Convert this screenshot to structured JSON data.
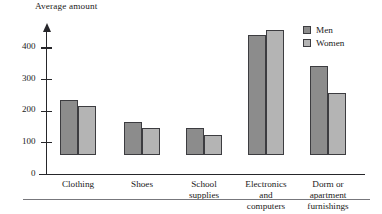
{
  "chart_data": {
    "type": "bar",
    "title": "Average amount",
    "xlabel": "",
    "ylabel": "Average amount",
    "ylim": [
      0,
      430
    ],
    "yticks": [
      0,
      100,
      200,
      300,
      400
    ],
    "ytick_labels": [
      "0",
      "100",
      "200",
      "300",
      "400"
    ],
    "grid": false,
    "legend_position": "top-right",
    "categories": [
      "Clothing",
      "Shoes",
      "School\nsupplies",
      "Electronics\nand\ncomputers",
      "Dorm or\napartment\nfurnishings"
    ],
    "series": [
      {
        "name": "Men",
        "color": "#8c8c8c",
        "values": [
          175,
          105,
          85,
          380,
          280
        ]
      },
      {
        "name": "Women",
        "color": "#b4b4b4",
        "values": [
          155,
          85,
          62,
          395,
          197
        ]
      }
    ]
  },
  "legend": {
    "items": [
      {
        "label": "Men"
      },
      {
        "label": "Women"
      }
    ]
  }
}
